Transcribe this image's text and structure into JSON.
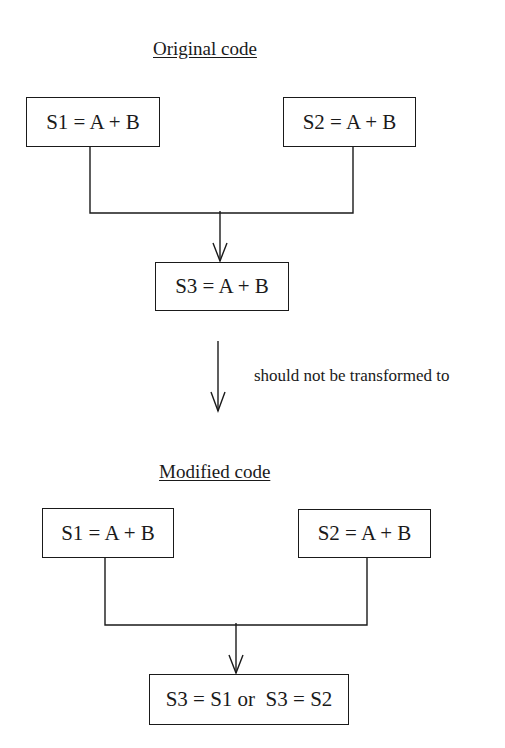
{
  "original": {
    "title": "Original code",
    "s1": "S1 = A + B",
    "s2": "S2 = A + B",
    "s3": "S3 = A + B"
  },
  "transition": {
    "label": "should not be transformed to"
  },
  "modified": {
    "title": "Modified code",
    "s1": "S1 = A + B",
    "s2": "S2 = A + B",
    "s3": "S3 = S1 or  S3 = S2"
  }
}
